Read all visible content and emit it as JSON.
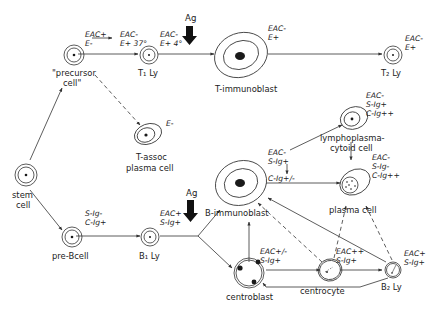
{
  "diagram": {
    "antigen_label": "Ag",
    "cells": {
      "stem": {
        "line1": "stem",
        "line2": "cell"
      },
      "precursor": {
        "line1": "\"precursor",
        "line2": "cell\"",
        "marker1": "EAC+",
        "marker2": "E-"
      },
      "t1": {
        "label": "T₁ Ly",
        "marker1": "EAC-",
        "marker2": "E+ 37°"
      },
      "t_immunoblast": {
        "label": "T-immunoblast",
        "marker_in1": "EAC-",
        "marker_in2": "E+ 4°",
        "marker1": "EAC-",
        "marker2": "E+"
      },
      "t2": {
        "label": "T₂ Ly",
        "marker1": "EAC-",
        "marker2": "E+"
      },
      "t_assoc_plasma": {
        "line1": "T-assoc",
        "line2": "plasma cell",
        "marker1": "E-"
      },
      "pre_b": {
        "label": "pre-Bcell",
        "marker1": "S-Ig-",
        "marker2": "C-Ig+"
      },
      "b1": {
        "label": "B₁ Ly",
        "marker1": "EAC+",
        "marker2": "S-Ig+"
      },
      "b_immunoblast": {
        "label": "B-immunoblast",
        "marker1": "EAC-",
        "marker2": "S-Ig+",
        "marker3": "C-Ig+/-"
      },
      "lymphoplasmacytoid": {
        "line1": "lymphoplasma-",
        "line2": "cytoid cell",
        "marker1": "EAC-",
        "marker2": "S-Ig+",
        "marker3": "C-Ig++"
      },
      "plasma": {
        "label": "plasma cell",
        "marker1": "EAC-",
        "marker2": "S-Ig-",
        "marker3": "C-Ig++"
      },
      "centroblast": {
        "label": "centroblast",
        "marker1": "EAC+/-",
        "marker2": "S-Ig+"
      },
      "centrocyte": {
        "label": "centrocyte",
        "marker1": "EAC++",
        "marker2": "S-Ig+"
      },
      "b2": {
        "label": "B₂ Ly",
        "marker1": "EAC+",
        "marker2": "S-Ig+"
      }
    },
    "colors": {
      "ink": "#222222",
      "background": "#ffffff"
    }
  }
}
